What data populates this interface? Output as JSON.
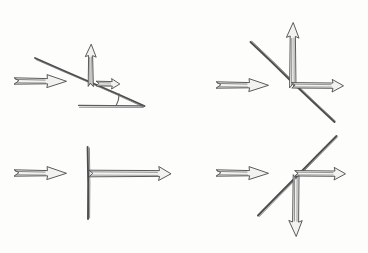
{
  "figure": {
    "background_color": "#fdfdfc",
    "ink_color": "#4d4d4d",
    "arrow_fill_color": "#f2f2f0",
    "width": 368,
    "height": 253,
    "panel_count": 4
  },
  "panels": [
    {
      "id": "top-left",
      "name": "incline-oblique-reflection",
      "description": "Incoming horizontal arrow meets a downward sloping incline; resolved into an upward vertical arrow and a small horizontal arrow, with an angle marked at the base",
      "incoming_arrow": {
        "name": "incoming-arrow",
        "direction": "right",
        "start": [
          14,
          81
        ],
        "end": [
          66,
          81
        ],
        "length": 52,
        "style": "hollow-outline"
      },
      "surface": {
        "name": "inclined-surface-line",
        "type": "line",
        "start": [
          35,
          58
        ],
        "end": [
          144,
          106
        ],
        "slope_direction": "down-right"
      },
      "baseline": {
        "name": "horizontal-baseline",
        "start": [
          78,
          106
        ],
        "end": [
          144,
          106
        ]
      },
      "angle_marker": {
        "name": "angle-arc",
        "vertex": [
          144,
          106
        ],
        "radius": 30,
        "opening": "left"
      },
      "component_arrows": [
        {
          "name": "vertical-component-arrow",
          "direction": "up",
          "start": [
            91,
            85
          ],
          "end": [
            91,
            45
          ],
          "length": 40
        },
        {
          "name": "horizontal-component-arrow",
          "direction": "right",
          "start": [
            97,
            84
          ],
          "end": [
            119,
            84
          ],
          "length": 22
        }
      ]
    },
    {
      "id": "top-right",
      "name": "diagonal-down-right-surface",
      "description": "Incoming horizontal arrow meets a diagonal line sloping down to the right; resolved into a tall upward vertical arrow and a long horizontal arrow from the intersection",
      "incoming_arrow": {
        "name": "incoming-arrow",
        "direction": "right",
        "start": [
          216,
          85
        ],
        "end": [
          268,
          85
        ],
        "length": 52,
        "style": "hollow-outline"
      },
      "surface": {
        "name": "diagonal-surface-line",
        "type": "line",
        "start": [
          250,
          42
        ],
        "end": [
          334,
          122
        ],
        "slope_direction": "down-right"
      },
      "component_arrows": [
        {
          "name": "vertical-component-arrow",
          "direction": "up",
          "start": [
            293,
            86
          ],
          "end": [
            293,
            23
          ],
          "length": 63
        },
        {
          "name": "horizontal-component-arrow",
          "direction": "right",
          "start": [
            293,
            86
          ],
          "end": [
            343,
            86
          ],
          "length": 50
        }
      ]
    },
    {
      "id": "bottom-left",
      "name": "vertical-wall-straight-through",
      "description": "Incoming horizontal arrow meets a vertical line; a single long horizontal arrow continues to the right from the wall",
      "incoming_arrow": {
        "name": "incoming-arrow",
        "direction": "right",
        "start": [
          14,
          173
        ],
        "end": [
          66,
          173
        ],
        "length": 52,
        "style": "hollow-outline"
      },
      "surface": {
        "name": "vertical-surface-line",
        "type": "line",
        "start": [
          88,
          147
        ],
        "end": [
          88,
          219
        ],
        "slope_direction": "vertical"
      },
      "component_arrows": [
        {
          "name": "horizontal-component-arrow",
          "direction": "right",
          "start": [
            90,
            174
          ],
          "end": [
            170,
            174
          ],
          "length": 80
        }
      ]
    },
    {
      "id": "bottom-right",
      "name": "diagonal-up-right-surface",
      "description": "Incoming horizontal arrow meets a diagonal line sloping up to the right; resolved into a horizontal arrow to the right and a long downward vertical arrow",
      "incoming_arrow": {
        "name": "incoming-arrow",
        "direction": "right",
        "start": [
          216,
          173
        ],
        "end": [
          268,
          173
        ],
        "length": 52,
        "style": "hollow-outline"
      },
      "surface": {
        "name": "diagonal-surface-line",
        "type": "line",
        "start": [
          258,
          215
        ],
        "end": [
          336,
          136
        ],
        "slope_direction": "up-right"
      },
      "component_arrows": [
        {
          "name": "horizontal-component-arrow",
          "direction": "right",
          "start": [
            296,
            174
          ],
          "end": [
            345,
            174
          ],
          "length": 49
        },
        {
          "name": "vertical-component-arrow",
          "direction": "down",
          "start": [
            296,
            176
          ],
          "end": [
            296,
            236
          ],
          "length": 60
        }
      ]
    }
  ]
}
